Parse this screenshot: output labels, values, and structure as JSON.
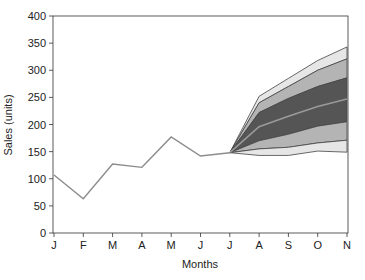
{
  "chart_data": {
    "type": "area",
    "title": "",
    "xlabel": "Months",
    "ylabel": "Sales (units)",
    "ylim": [
      0,
      400
    ],
    "yticks": [
      0,
      50,
      100,
      150,
      200,
      250,
      300,
      350,
      400
    ],
    "categories": [
      "J",
      "F",
      "M",
      "A",
      "M",
      "J",
      "J",
      "A",
      "S",
      "O",
      "N"
    ],
    "grid": false,
    "legend": "none",
    "series": [
      {
        "name": "Actual sales",
        "type": "line",
        "values": [
          107,
          63,
          127,
          121,
          177,
          142,
          148,
          null,
          null,
          null,
          null
        ]
      }
    ],
    "fan": {
      "start_index": 6,
      "start_value": 148,
      "months": [
        "A",
        "S",
        "O",
        "N"
      ],
      "bands": [
        {
          "name": "outer upper",
          "upper": [
            252,
            285,
            318,
            343
          ],
          "lower": [
            240,
            270,
            300,
            321
          ]
        },
        {
          "name": "middle upper",
          "upper": [
            240,
            270,
            300,
            321
          ],
          "lower": [
            222,
            248,
            270,
            286
          ]
        },
        {
          "name": "inner",
          "upper": [
            222,
            248,
            270,
            286
          ],
          "lower": [
            170,
            182,
            197,
            205
          ]
        },
        {
          "name": "middle lower",
          "upper": [
            170,
            182,
            197,
            205
          ],
          "lower": [
            155,
            158,
            166,
            171
          ]
        },
        {
          "name": "outer lower",
          "upper": [
            155,
            158,
            166,
            171
          ],
          "lower": [
            143,
            143,
            151,
            149
          ]
        }
      ],
      "median": [
        196,
        215,
        233,
        247
      ]
    },
    "colors": {
      "line": "#8c8c8c",
      "outer": "#e6e6e6",
      "middle": "#b4b4b4",
      "inner": "#555555",
      "median": "#9a9a9a",
      "axis": "#333333"
    }
  }
}
